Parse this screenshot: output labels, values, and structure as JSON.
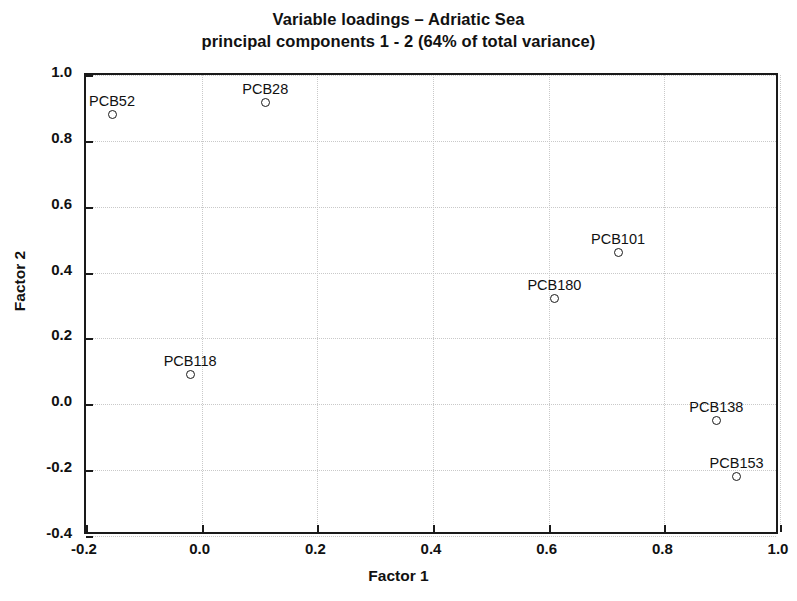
{
  "chart_data": {
    "type": "scatter",
    "title": "Variable loadings – Adriatic Sea\nprincipal components 1 - 2 (64% of total variance)",
    "title_line1": "Variable loadings – Adriatic Sea",
    "title_line2": "principal components 1 - 2 (64% of total variance)",
    "xlabel": "Factor 1",
    "ylabel": "Factor 2",
    "xlim": [
      -0.2,
      1.0
    ],
    "ylim": [
      -0.4,
      1.0
    ],
    "xticks": [
      "-0.2",
      "0.0",
      "0.2",
      "0.4",
      "0.6",
      "0.8",
      "1.0"
    ],
    "xtick_values": [
      -0.2,
      0.0,
      0.2,
      0.4,
      0.6,
      0.8,
      1.0
    ],
    "yticks": [
      "1.0",
      "0.8",
      "0.6",
      "0.4",
      "0.2",
      "0.0",
      "-0.2",
      "-0.4"
    ],
    "ytick_values": [
      1.0,
      0.8,
      0.6,
      0.4,
      0.2,
      0.0,
      -0.2,
      -0.4
    ],
    "grid": true,
    "legend": "none",
    "marker": "open-circle",
    "points": [
      {
        "label": "PCB52",
        "x": -0.155,
        "y": 0.88,
        "label_dx": 0,
        "label_dy": -22
      },
      {
        "label": "PCB28",
        "x": 0.11,
        "y": 0.915,
        "label_dx": 0,
        "label_dy": -22
      },
      {
        "label": "PCB101",
        "x": 0.72,
        "y": 0.46,
        "label_dx": 0,
        "label_dy": -22
      },
      {
        "label": "PCB180",
        "x": 0.61,
        "y": 0.32,
        "label_dx": 0,
        "label_dy": -22
      },
      {
        "label": "PCB118",
        "x": -0.02,
        "y": 0.09,
        "label_dx": 0,
        "label_dy": -22
      },
      {
        "label": "PCB138",
        "x": 0.89,
        "y": -0.05,
        "label_dx": 0,
        "label_dy": -22
      },
      {
        "label": "PCB153",
        "x": 0.925,
        "y": -0.22,
        "label_dx": 0,
        "label_dy": -22
      }
    ]
  },
  "colors": {
    "axis": "#1a1a1a",
    "grid": "#c9c9c9",
    "marker": "#1a1a1a",
    "background": "#ffffff"
  }
}
